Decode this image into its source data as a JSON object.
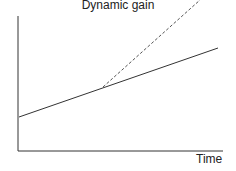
{
  "diagram": {
    "title": "Dynamic gain",
    "xlabel": "Time",
    "ylabel": "",
    "lines": [
      {
        "name": "baseline-growth",
        "style": "solid",
        "from": [
          19,
          117
        ],
        "to": [
          218,
          48
        ]
      },
      {
        "name": "dynamic-gain-growth",
        "style": "dashed",
        "from": [
          103,
          87
        ],
        "to": [
          200,
          0
        ]
      }
    ],
    "colors": {
      "line": "#333333",
      "text": "#222222"
    }
  }
}
